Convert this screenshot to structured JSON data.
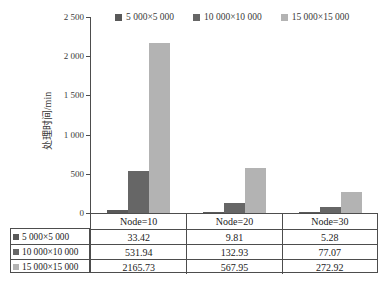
{
  "chart_data": {
    "type": "bar",
    "title": "",
    "xlabel": "",
    "ylabel": "处理时间/min",
    "ylim": [
      0,
      2500
    ],
    "yticks": [
      {
        "value": 2500,
        "label": "2 500"
      },
      {
        "value": 2000,
        "label": "2 000"
      },
      {
        "value": 1500,
        "label": "1 500"
      },
      {
        "value": 1000,
        "label": "1 000"
      },
      {
        "value": 500,
        "label": "500"
      },
      {
        "value": 0,
        "label": "0"
      }
    ],
    "categories": [
      "Node=10",
      "Node=20",
      "Node=30"
    ],
    "series": [
      {
        "name": "5 000×5 000",
        "color": "#595959",
        "values": [
          33.42,
          9.81,
          5.28
        ]
      },
      {
        "name": "10 000×10 000",
        "color": "#666666",
        "values": [
          531.94,
          132.93,
          77.07
        ]
      },
      {
        "name": "15 000×15 000",
        "color": "#b3b3b3",
        "values": [
          2165.73,
          567.95,
          272.92
        ]
      }
    ],
    "legend_position": "top",
    "grid": false,
    "data_table": {
      "header": [
        "Node=10",
        "Node=20",
        "Node=30"
      ],
      "rows": [
        {
          "label": "5 000×5 000",
          "values": [
            "33.42",
            "9.81",
            "5.28"
          ]
        },
        {
          "label": "10 000×10 000",
          "values": [
            "531.94",
            "132.93",
            "77.07"
          ]
        },
        {
          "label": "15 000×15 000",
          "values": [
            "2165.73",
            "567.95",
            "272.92"
          ]
        }
      ]
    }
  },
  "colors": {
    "axis": "#4d4d4d",
    "table_border": "#4d4d4d",
    "text": "#3a3a3a",
    "background": "#ffffff"
  }
}
